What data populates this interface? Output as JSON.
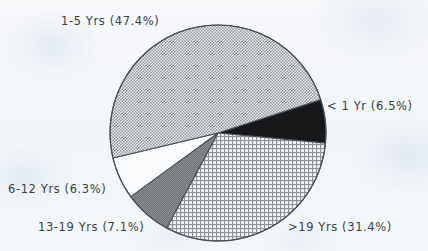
{
  "chart_data": {
    "type": "pie",
    "title": "",
    "subtitle": "",
    "xlabel": "",
    "ylabel": "",
    "legend_position": "none",
    "grid": false,
    "categories": [
      "1-5 Yrs",
      "<1 Yr",
      ">19 Yrs",
      "13-19 Yrs",
      "6-12 Yrs"
    ],
    "values": [
      47.4,
      6.5,
      31.4,
      7.1,
      6.3
    ],
    "unit": "%",
    "slices": [
      {
        "key": "lt1",
        "category": "< 1 Yr",
        "value": 6.5,
        "label": "< 1 Yr (6.5%)",
        "fill_style": "solid-black",
        "color": "#141414",
        "start_angle_deg": -18.0,
        "end_angle_deg": 5.4
      },
      {
        "key": "gt19",
        "category": ">19 Yrs",
        "value": 31.4,
        "label": ">19 Yrs (31.4%)",
        "fill_style": "crosshatch-grid",
        "color": "#b9bec4",
        "start_angle_deg": 5.4,
        "end_angle_deg": 118.4
      },
      {
        "key": "13-19",
        "category": "13-19 Yrs",
        "value": 7.1,
        "label": "13-19 Yrs (7.1%)",
        "fill_style": "solid-dark-gray",
        "color": "#7b7f84",
        "start_angle_deg": 118.4,
        "end_angle_deg": 143.9
      },
      {
        "key": "6-12",
        "category": "6-12 Yrs",
        "value": 6.3,
        "label": "6-12 Yrs (6.3%)",
        "fill_style": "blank-white",
        "color": "#f8fafb",
        "start_angle_deg": 143.9,
        "end_angle_deg": 166.6
      },
      {
        "key": "1-5",
        "category": "1-5 Yrs",
        "value": 47.4,
        "label": "1-5 Yrs (47.4%)",
        "fill_style": "fine-checker",
        "color": "#b4b9bf",
        "start_angle_deg": 166.6,
        "end_angle_deg": 342.0
      }
    ],
    "geometry": {
      "center_x": 218,
      "center_y": 133,
      "radius": 108
    },
    "colors": {
      "background": "#f4f7fa",
      "outline": "#4a4f55",
      "label_text": "#3a3f45"
    }
  }
}
